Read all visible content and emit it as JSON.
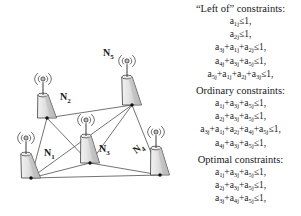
{
  "figure": {
    "kind": "network-diagram-with-constraint-list"
  },
  "diagram": {
    "title": "",
    "nodes": [
      {
        "id": "N1",
        "label": "N",
        "sub": "1",
        "base_x": 31,
        "base_y": 178,
        "mast_top_x": 26,
        "mast_top_y": 138,
        "label_x": 44,
        "label_y": 148,
        "tilt": false
      },
      {
        "id": "N2",
        "label": "N",
        "sub": "2",
        "base_x": 47,
        "base_y": 118,
        "mast_top_x": 43,
        "mast_top_y": 79,
        "label_x": 60,
        "label_y": 92,
        "tilt": false
      },
      {
        "id": "N3",
        "label": "N",
        "sub": "3",
        "base_x": 90,
        "base_y": 163,
        "mast_top_x": 86,
        "mast_top_y": 120,
        "label_x": 99,
        "label_y": 144,
        "tilt": false
      },
      {
        "id": "N4",
        "label": "N",
        "sub": "4",
        "base_x": 160,
        "base_y": 175,
        "mast_top_x": 156,
        "mast_top_y": 132,
        "label_x": 139,
        "label_y": 145,
        "tilt": true
      },
      {
        "id": "N5",
        "label": "N",
        "sub": "5",
        "base_x": 132,
        "base_y": 105,
        "mast_top_x": 127,
        "mast_top_y": 61,
        "label_x": 103,
        "label_y": 48,
        "tilt": false
      }
    ],
    "edges": [
      [
        "N2",
        "N5"
      ],
      [
        "N2",
        "N3"
      ],
      [
        "N2",
        "N1"
      ],
      [
        "N1",
        "N3"
      ],
      [
        "N1",
        "N5"
      ],
      [
        "N3",
        "N5"
      ],
      [
        "N3",
        "N4"
      ],
      [
        "N4",
        "N5"
      ],
      [
        "N1",
        "N4"
      ]
    ],
    "colors": {
      "edge": "#4a4a4a",
      "tower_fill": "#d9d9d9",
      "tower_stroke": "#3c3c3c",
      "node_dot": "#111111",
      "antenna_wave": "#555555"
    }
  },
  "constraints": {
    "groups": [
      {
        "heading": "“Left of” constraints:",
        "equations": [
          {
            "terms": [
              "a|1j"
            ],
            "rhs": "≤1,"
          },
          {
            "terms": [
              "a|2j"
            ],
            "rhs": "≤1,"
          },
          {
            "terms": [
              "a|3j",
              "a|1j",
              "a|2j"
            ],
            "rhs": "≤1,"
          },
          {
            "terms": [
              "a|4j",
              "a|3j",
              "a|5j"
            ],
            "rhs": "≤1,"
          },
          {
            "terms": [
              "a|5j",
              "a|1j",
              "a|2j",
              "a|3j"
            ],
            "rhs": "≤1,"
          }
        ]
      },
      {
        "heading": "Ordinary constraints:",
        "equations": [
          {
            "terms": [
              "a|1j",
              "a|3j",
              "a|5j"
            ],
            "rhs": "≤1,"
          },
          {
            "terms": [
              "a|2j",
              "a|3j",
              "a|5j"
            ],
            "rhs": "≤1,"
          },
          {
            "terms": [
              "a|3j",
              "a|1j",
              "a|2j",
              "a|4j",
              "a|5j"
            ],
            "rhs": "≤1,"
          },
          {
            "terms": [
              "a|4j",
              "a|3j",
              "a|5j"
            ],
            "rhs": "≤1,"
          }
        ]
      },
      {
        "heading": "Optimal constraints:",
        "equations": [
          {
            "terms": [
              "a|1j",
              "a|3j",
              "a|5j"
            ],
            "rhs": "≤1,"
          },
          {
            "terms": [
              "a|2j",
              "a|3j",
              "a|5j"
            ],
            "rhs": "≤1,"
          },
          {
            "terms": [
              "a|3j",
              "a|4j",
              "a|5j"
            ],
            "rhs": "≤1,"
          }
        ]
      }
    ]
  }
}
